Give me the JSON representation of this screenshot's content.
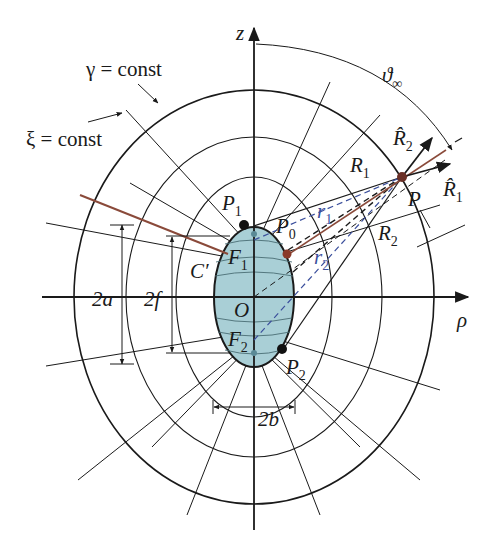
{
  "diagram": {
    "type": "prolate spheroidal coordinate system",
    "axes": {
      "vertical": "z",
      "horizontal": "ρ"
    },
    "curve_labels": {
      "gamma": "γ = const",
      "xi": "ξ = const"
    },
    "angle_label": "ϑ",
    "angle_sub": "∞",
    "points": {
      "P1": {
        "main": "P",
        "sub": "1"
      },
      "P0": {
        "main": "P",
        "sub": "0"
      },
      "P2": {
        "main": "P",
        "sub": "2"
      },
      "P": {
        "main": "P"
      },
      "F1": {
        "main": "F",
        "sub": "1"
      },
      "F2": {
        "main": "F",
        "sub": "2"
      },
      "O": {
        "main": "O"
      },
      "C": {
        "main": "C′"
      }
    },
    "distances": {
      "R1": {
        "main": "R",
        "sub": "1"
      },
      "R2": {
        "main": "R",
        "sub": "2"
      },
      "r1": {
        "main": "r",
        "sub": "1"
      },
      "r2": {
        "main": "r",
        "sub": "2"
      }
    },
    "unit_vectors": {
      "R1hat": {
        "main": "R̂",
        "sub": "1"
      },
      "R2hat": {
        "main": "R̂",
        "sub": "2"
      }
    },
    "dimensions": {
      "major": "2a",
      "focal": "2f",
      "minor": "2b"
    },
    "colors": {
      "line": "#1a1a1a",
      "ellipse_fill": "#a9cfd6",
      "ray": "#8a4a3a",
      "dashed": "#3b4f9c",
      "point": "#111111",
      "p0_point": "#8a3a2a"
    }
  }
}
